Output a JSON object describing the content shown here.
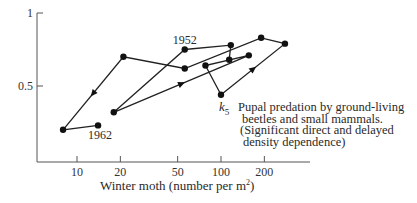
{
  "chart_data": {
    "type": "line",
    "title": "",
    "xlabel": "Winter moth (number per m²)",
    "xlabel_base": "Winter moth (number per m",
    "xlabel_sup": "2",
    "xlabel_tail": ")",
    "ylabel": "",
    "xscale": "log",
    "xlim": [
      5,
      350
    ],
    "ylim": [
      0,
      1
    ],
    "x_ticks": [
      10,
      20,
      50,
      100,
      200
    ],
    "x_tick_labels": [
      "10",
      "20",
      "50",
      "100",
      "200"
    ],
    "y_ticks": [
      0.5,
      1
    ],
    "y_tick_labels": [
      "0.5",
      "1"
    ],
    "grid": false,
    "series": [
      {
        "name": "k5 by year (1950–1962)",
        "years": [
          1950,
          1951,
          1952,
          1953,
          1954,
          1955,
          1956,
          1957,
          1958,
          1959,
          1960,
          1961,
          1962
        ],
        "x": [
          114,
          117,
          56,
          18,
          156,
          78,
          100,
          278,
          190,
          56,
          21,
          8,
          14
        ],
        "y": [
          0.68,
          0.78,
          0.75,
          0.32,
          0.71,
          0.64,
          0.44,
          0.79,
          0.83,
          0.62,
          0.7,
          0.2,
          0.23
        ]
      }
    ],
    "annotations": [
      {
        "text": "1952",
        "at_year": 1952
      },
      {
        "text": "1962",
        "at_year": 1962
      }
    ],
    "direction_arrows": [
      {
        "from_year": 1953,
        "to_year": 1954
      },
      {
        "from_year": 1956,
        "to_year": 1957
      },
      {
        "from_year": 1960,
        "to_year": 1961
      }
    ]
  },
  "legend": {
    "k_symbol": "k",
    "k_subscript": "5",
    "lines": [
      "Pupal predation by ground-living",
      "beetles and small mammals.",
      "(Significant direct and delayed",
      "density dependence)"
    ]
  }
}
